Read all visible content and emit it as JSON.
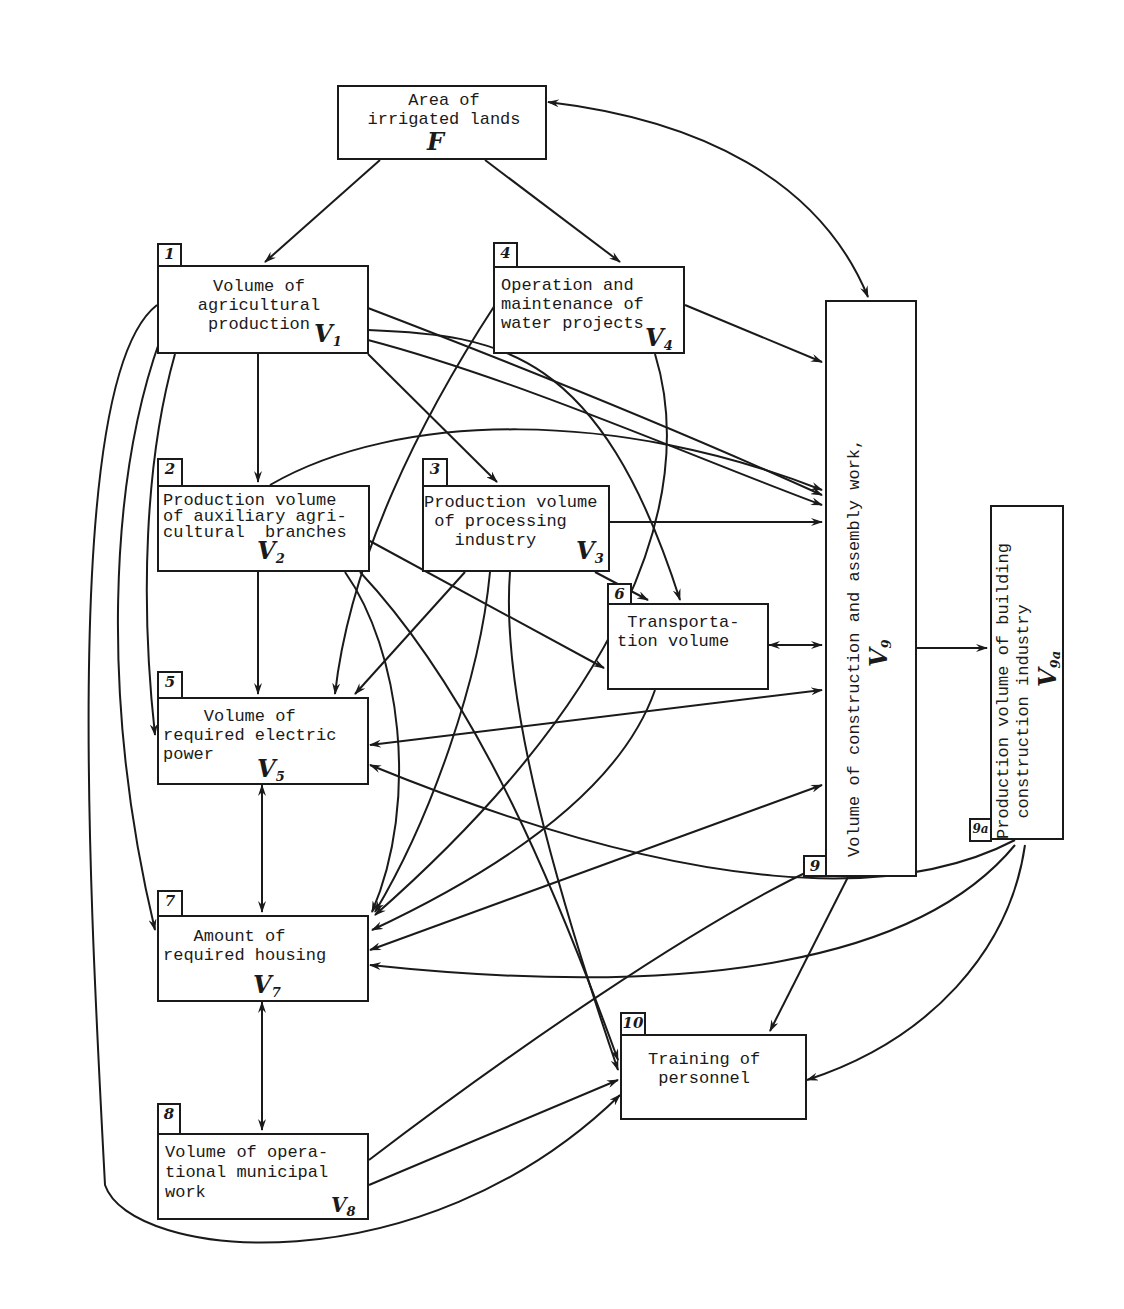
{
  "diagram": {
    "nodes": {
      "F": {
        "number": "",
        "lines": "Area of\nirrigated lands",
        "var": "F",
        "sub": ""
      },
      "n1": {
        "number": "1",
        "lines": "Volume of\nagricultural\nproduction",
        "var": "V",
        "sub": "1"
      },
      "n2": {
        "number": "2",
        "lines": "Production volume\nof auxiliary agri-\ncultural  branches",
        "var": "V",
        "sub": "2"
      },
      "n3": {
        "number": "3",
        "lines": "Production volume\n of processing\n   industry",
        "var": "V",
        "sub": "3"
      },
      "n4": {
        "number": "4",
        "lines": "Operation and\nmaintenance of\nwater projects",
        "var": "V",
        "sub": "4"
      },
      "n5": {
        "number": "5",
        "lines": "    Volume of\nrequired electric\npower",
        "var": "V",
        "sub": "5"
      },
      "n6": {
        "number": "6",
        "lines": " Transporta-\ntion volume",
        "var": "",
        "sub": ""
      },
      "n7": {
        "number": "7",
        "lines": "   Amount of\nrequired housing",
        "var": "V",
        "sub": "7"
      },
      "n8": {
        "number": "8",
        "lines": "Volume of opera-\ntional municipal\nwork",
        "var": "V",
        "sub": "8"
      },
      "n9": {
        "number": "9",
        "lines": "Volume of construction and assembly work,",
        "var": "V",
        "sub": "9"
      },
      "n9a": {
        "number": "9a",
        "lines": "Production volume of building\n  construction industry",
        "var": "V",
        "sub": "9a"
      },
      "n10": {
        "number": "10",
        "lines": "Training of\n personnel",
        "var": "",
        "sub": ""
      }
    },
    "edges": [
      [
        "F",
        "n1"
      ],
      [
        "F",
        "n4"
      ],
      [
        "F",
        "n9",
        "bidirectional"
      ],
      [
        "n1",
        "n2"
      ],
      [
        "n1",
        "n3"
      ],
      [
        "n1",
        "n5"
      ],
      [
        "n1",
        "n7"
      ],
      [
        "n1",
        "n9"
      ],
      [
        "n1",
        "n6"
      ],
      [
        "n1",
        "n10"
      ],
      [
        "n2",
        "n5"
      ],
      [
        "n2",
        "n6"
      ],
      [
        "n2",
        "n9"
      ],
      [
        "n2",
        "n7"
      ],
      [
        "n2",
        "n10"
      ],
      [
        "n3",
        "n6"
      ],
      [
        "n3",
        "n9"
      ],
      [
        "n3",
        "n5"
      ],
      [
        "n3",
        "n7"
      ],
      [
        "n3",
        "n10"
      ],
      [
        "n4",
        "n9"
      ],
      [
        "n4",
        "n5"
      ],
      [
        "n4",
        "n7"
      ],
      [
        "n6",
        "n9",
        "bidirectional"
      ],
      [
        "n6",
        "n7"
      ],
      [
        "n5",
        "n7",
        "bidirectional"
      ],
      [
        "n7",
        "n8",
        "bidirectional"
      ],
      [
        "n9",
        "n5"
      ],
      [
        "n5",
        "n9"
      ],
      [
        "n9",
        "n7"
      ],
      [
        "n7",
        "n9"
      ],
      [
        "n9",
        "n9a"
      ],
      [
        "n9",
        "n10"
      ],
      [
        "n8",
        "n9"
      ],
      [
        "n8",
        "n10"
      ],
      [
        "n9a",
        "n5"
      ],
      [
        "n9a",
        "n7"
      ],
      [
        "n9a",
        "n10"
      ]
    ]
  }
}
